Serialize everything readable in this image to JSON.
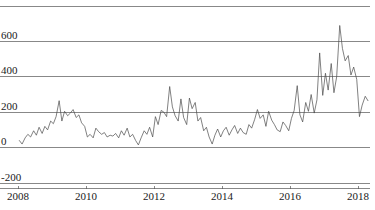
{
  "chart_data": {
    "type": "line",
    "title": "",
    "subtitle": "",
    "xlabel": "",
    "ylabel": "",
    "xlim": [
      2008.0,
      2018.35
    ],
    "ylim": [
      -200,
      800
    ],
    "grid": true,
    "legend": null,
    "x_ticks": [
      "2008",
      "2010",
      "2012",
      "2014",
      "2016",
      "2018"
    ],
    "x_tick_values": [
      2008,
      2010,
      2012,
      2014,
      2016,
      2018
    ],
    "y_ticks": [
      "-200",
      "0",
      "200",
      "400",
      "600"
    ],
    "y_tick_values": [
      -200,
      0,
      200,
      400,
      600
    ],
    "y_gridline_values": [
      -200,
      0,
      200,
      400,
      600,
      800
    ],
    "line_color": "#4a4a4a",
    "grid_color": "#555555",
    "background_color": "#ffffff",
    "series": [
      {
        "name": "series-1",
        "x": [
          2008.04,
          2008.12,
          2008.21,
          2008.29,
          2008.37,
          2008.46,
          2008.54,
          2008.62,
          2008.71,
          2008.79,
          2008.87,
          2008.96,
          2009.04,
          2009.12,
          2009.21,
          2009.29,
          2009.37,
          2009.46,
          2009.54,
          2009.62,
          2009.71,
          2009.79,
          2009.87,
          2009.96,
          2010.04,
          2010.12,
          2010.21,
          2010.29,
          2010.37,
          2010.46,
          2010.54,
          2010.62,
          2010.71,
          2010.79,
          2010.87,
          2010.96,
          2011.04,
          2011.12,
          2011.21,
          2011.29,
          2011.37,
          2011.46,
          2011.54,
          2011.62,
          2011.71,
          2011.79,
          2011.87,
          2011.96,
          2012.04,
          2012.12,
          2012.21,
          2012.29,
          2012.37,
          2012.46,
          2012.54,
          2012.62,
          2012.71,
          2012.79,
          2012.87,
          2012.96,
          2013.04,
          2013.12,
          2013.21,
          2013.29,
          2013.37,
          2013.46,
          2013.54,
          2013.62,
          2013.71,
          2013.79,
          2013.87,
          2013.96,
          2014.04,
          2014.12,
          2014.21,
          2014.29,
          2014.37,
          2014.46,
          2014.54,
          2014.62,
          2014.71,
          2014.79,
          2014.87,
          2014.96,
          2015.04,
          2015.12,
          2015.21,
          2015.29,
          2015.37,
          2015.46,
          2015.54,
          2015.62,
          2015.71,
          2015.79,
          2015.87,
          2015.96,
          2016.04,
          2016.12,
          2016.21,
          2016.29,
          2016.37,
          2016.46,
          2016.54,
          2016.62,
          2016.71,
          2016.79,
          2016.87,
          2016.96,
          2017.04,
          2017.12,
          2017.21,
          2017.29,
          2017.37,
          2017.46,
          2017.54,
          2017.62,
          2017.71,
          2017.79,
          2017.87,
          2017.96,
          2018.04,
          2018.12,
          2018.21,
          2018.29
        ],
        "y": [
          40,
          20,
          55,
          75,
          60,
          95,
          70,
          115,
          80,
          120,
          100,
          150,
          135,
          175,
          265,
          150,
          205,
          180,
          195,
          215,
          170,
          185,
          140,
          120,
          60,
          75,
          55,
          110,
          90,
          75,
          85,
          60,
          70,
          65,
          80,
          55,
          95,
          70,
          110,
          60,
          75,
          40,
          15,
          55,
          95,
          75,
          115,
          60,
          175,
          130,
          210,
          200,
          175,
          345,
          230,
          180,
          150,
          275,
          170,
          130,
          280,
          220,
          255,
          150,
          170,
          95,
          115,
          60,
          20,
          70,
          105,
          60,
          95,
          115,
          70,
          100,
          125,
          80,
          110,
          85,
          75,
          130,
          110,
          160,
          215,
          165,
          185,
          120,
          205,
          155,
          130,
          100,
          90,
          145,
          125,
          95,
          165,
          210,
          350,
          185,
          145,
          255,
          205,
          300,
          195,
          270,
          535,
          295,
          420,
          325,
          475,
          310,
          400,
          690,
          560,
          490,
          520,
          410,
          455,
          385,
          175,
          240,
          290,
          265
        ]
      }
    ]
  },
  "figure": {
    "plot_left_px": 18,
    "plot_right_px": 370,
    "plot_top_px": 6,
    "plot_bottom_px": 183
  }
}
